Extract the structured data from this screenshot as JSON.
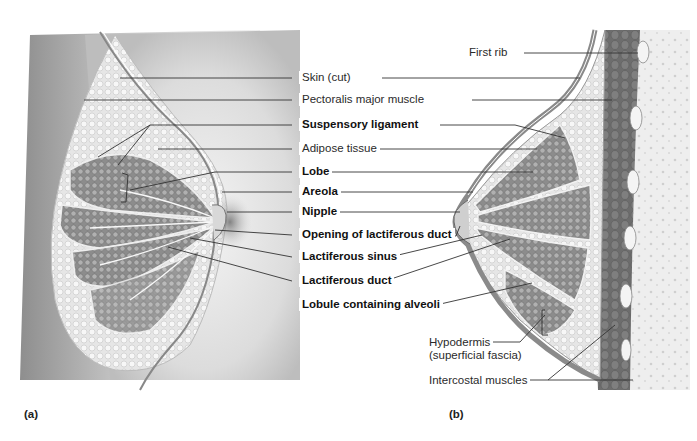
{
  "figure": {
    "panel_a": "(a)",
    "panel_b": "(b)"
  },
  "labels": {
    "first_rib": "First rib",
    "skin_cut": "Skin (cut)",
    "pectoralis_major": "Pectoralis major muscle",
    "suspensory_ligament": "Suspensory ligament",
    "adipose_tissue": "Adipose tissue",
    "lobe": "Lobe",
    "areola": "Areola",
    "nipple": "Nipple",
    "opening_lactiferous_duct": "Opening of lactiferous duct",
    "lactiferous_sinus": "Lactiferous sinus",
    "lactiferous_duct": "Lactiferous duct",
    "lobule_alveoli": "Lobule containing alveoli",
    "hypodermis_line1": "Hypodermis",
    "hypodermis_line2": "(superficial fascia)",
    "intercostal_muscles": "Intercostal muscles"
  },
  "colors": {
    "leader_line": "#333333",
    "tissue_gray": "#9a9a9a",
    "muscle_dark": "#6e6e6e",
    "fat_light": "#e8e8e8"
  }
}
